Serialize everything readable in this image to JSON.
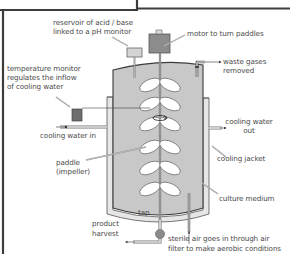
{
  "diagram": {
    "colors": {
      "frame": "#3c3c3c",
      "culture_medium": "#c8c8c8",
      "jacket": "#e6e6e6",
      "outline": "#3a3a3a",
      "motor": "#8c8c8c",
      "reservoir": "#d4d4d4",
      "temp_monitor": "#6e6e6e",
      "tap": "#8a8a8a",
      "paddle": "#ffffff",
      "label_text": "#4a4a4a"
    },
    "labels": {
      "reservoir_line1": "reservoir of acid / base",
      "reservoir_line2": "linked to a pH monitor",
      "motor": "motor to turn paddles",
      "temperature_line1": "temperature monitor",
      "temperature_line2": "regulates the inflow",
      "temperature_line3": "of cooling water",
      "waste_line1": "waste gases",
      "waste_line2": "removed",
      "cooling_in": "cooling water in",
      "cooling_out_line1": "cooling water",
      "cooling_out_line2": "out",
      "paddle_line1": "paddle",
      "paddle_line2": "(impeller)",
      "cooling_jacket": "cooling jacket",
      "culture_medium": "culture medium",
      "tap": "tap",
      "product_line1": "product",
      "product_line2": "harvest",
      "air_line1": "sterile air goes in through air",
      "air_line2": "filter to make aerobic conditions"
    },
    "components": [
      "reservoir",
      "motor",
      "shaft",
      "paddles",
      "vessel",
      "cooling-jacket",
      "temperature-monitor",
      "waste-gas-outlet",
      "cooling-water-inlet",
      "cooling-water-outlet",
      "tap",
      "product-harvest-pipe",
      "sterile-air-inlet"
    ]
  }
}
